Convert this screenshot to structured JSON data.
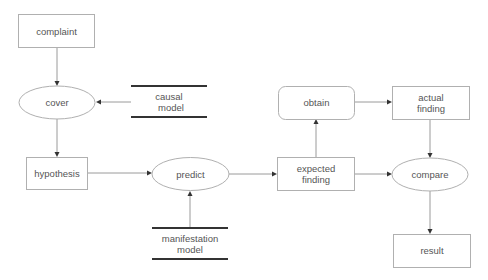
{
  "diagram": {
    "type": "flowchart",
    "colors": {
      "background": "#ffffff",
      "shape_stroke": "#b0b0b0",
      "edge_stroke": "#9a9a9a",
      "text": "#555555",
      "data_store_line": "#333333",
      "arrowhead": "#333333"
    },
    "nodes": {
      "complaint": {
        "label": "complaint",
        "shape": "rectangle"
      },
      "cover": {
        "label": "cover",
        "shape": "ellipse"
      },
      "causal_model": {
        "line1": "causal",
        "line2": "model",
        "shape": "data-store"
      },
      "hypothesis": {
        "label": "hypothesis",
        "shape": "rectangle"
      },
      "predict": {
        "label": "predict",
        "shape": "ellipse"
      },
      "manifestation_model": {
        "line1": "manifestation",
        "line2": "model",
        "shape": "data-store"
      },
      "expected_finding": {
        "line1": "expected",
        "line2": "finding",
        "shape": "rectangle"
      },
      "obtain": {
        "label": "obtain",
        "shape": "rounded-rectangle"
      },
      "actual_finding": {
        "line1": "actual",
        "line2": "finding",
        "shape": "rectangle"
      },
      "compare": {
        "label": "compare",
        "shape": "ellipse"
      },
      "result": {
        "label": "result",
        "shape": "rectangle"
      }
    },
    "edges": [
      {
        "from": "complaint",
        "to": "cover"
      },
      {
        "from": "causal model",
        "to": "cover"
      },
      {
        "from": "cover",
        "to": "hypothesis"
      },
      {
        "from": "hypothesis",
        "to": "predict"
      },
      {
        "from": "manifestation model",
        "to": "predict"
      },
      {
        "from": "predict",
        "to": "expected finding"
      },
      {
        "from": "expected finding",
        "to": "obtain"
      },
      {
        "from": "obtain",
        "to": "actual finding"
      },
      {
        "from": "expected finding",
        "to": "compare"
      },
      {
        "from": "actual finding",
        "to": "compare"
      },
      {
        "from": "compare",
        "to": "result"
      }
    ]
  }
}
